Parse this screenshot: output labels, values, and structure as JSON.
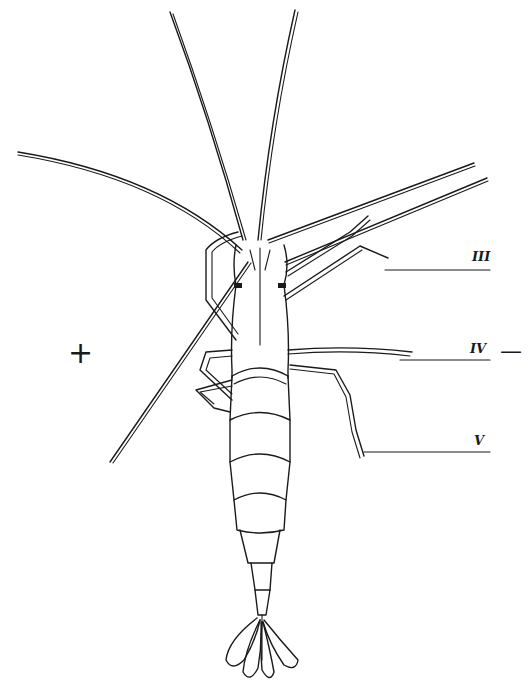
{
  "figure": {
    "stroke_color": "#1a1a1a",
    "background": "#ffffff"
  },
  "labels": {
    "leg_iii": "III",
    "leg_iv": "IV",
    "leg_v": "V"
  },
  "poles": {
    "positive": "+",
    "negative": "—"
  }
}
